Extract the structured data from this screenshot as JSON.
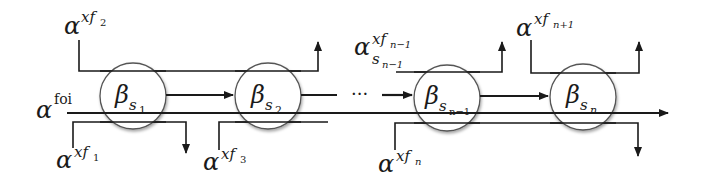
{
  "diagram": {
    "type": "flow-chain",
    "nodes": [
      {
        "id": "s1",
        "symbol": "β",
        "subscript": "s",
        "subsub": "1"
      },
      {
        "id": "s2",
        "symbol": "β",
        "subscript": "s",
        "subsub": "2"
      },
      {
        "id": "sn-1",
        "symbol": "β",
        "subscript": "s",
        "subsub": "n−1"
      },
      {
        "id": "sn",
        "symbol": "β",
        "subscript": "s",
        "subsub": "n"
      }
    ],
    "ellipsis": "···",
    "labels": {
      "foi": {
        "base": "α",
        "sup": "foi"
      },
      "xf1": {
        "base": "α",
        "sup": "xf",
        "supsub": "1"
      },
      "xf2": {
        "base": "α",
        "sup": "xf",
        "supsub": "2"
      },
      "xf3": {
        "base": "α",
        "sup": "xf",
        "supsub": "3"
      },
      "xfn1": {
        "base": "α",
        "sup": "xf",
        "supsub": "n−1",
        "sub": "s",
        "subsub": "n−1"
      },
      "xfn": {
        "base": "α",
        "sup": "xf",
        "supsub": "n"
      },
      "xfnp1": {
        "base": "α",
        "sup": "xf",
        "supsub": "n+1"
      }
    }
  }
}
